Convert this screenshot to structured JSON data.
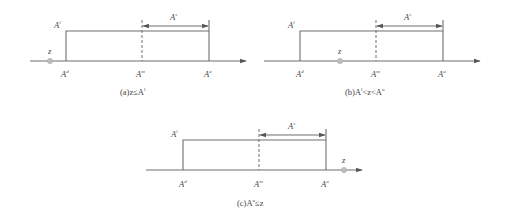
{
  "panels": [
    {
      "id": "a",
      "caption": "(a)z≤A",
      "caption_sup": "l",
      "labels": {
        "top": "A",
        "top_sup": "l",
        "left": "A",
        "left_sup": "d",
        "mid": "A",
        "mid_sup": "m",
        "right": "A",
        "right_sup": "u",
        "span": "A",
        "span_sup": "s",
        "point": "z"
      },
      "z_position": "left of A^d"
    },
    {
      "id": "b",
      "caption": "(b)A",
      "caption_sup1": "l",
      "caption_mid": "<z<A",
      "caption_sup2": "u",
      "labels": {
        "top": "A",
        "top_sup": "l",
        "left": "A",
        "left_sup": "d",
        "mid": "A",
        "mid_sup": "m",
        "right": "A",
        "right_sup": "u",
        "span": "A",
        "span_sup": "s",
        "point": "z"
      },
      "z_position": "between A^d and A^m"
    },
    {
      "id": "c",
      "caption": "(c)A",
      "caption_sup": "u",
      "caption_tail": "≤z",
      "labels": {
        "top": "A",
        "top_sup": "l",
        "left": "A",
        "left_sup": "d",
        "mid": "A",
        "mid_sup": "m",
        "right": "A",
        "right_sup": "u",
        "span": "A",
        "span_sup": "s",
        "point": "z"
      },
      "z_position": "right of A^u"
    }
  ]
}
